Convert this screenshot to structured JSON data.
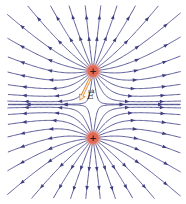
{
  "diagram": {
    "charges": [
      {
        "name": "upper-charge",
        "sign": "+",
        "x": 93,
        "y": 71,
        "r": 5.5
      },
      {
        "name": "lower-charge",
        "sign": "+",
        "x": 93,
        "y": 138,
        "r": 5.5
      }
    ],
    "field_vector": {
      "label": "E",
      "from": [
        90,
        79
      ],
      "to": [
        80,
        100
      ],
      "label_x": 87,
      "label_y": 92
    },
    "lines_per_charge": 24,
    "colors": {
      "field_line": "#4a4a8c",
      "arrow": "#3e3e80",
      "charge_fill": "#e06a55",
      "charge_glow": "#f3b3a5",
      "charge_sign": "#222222",
      "vector": "#e08a3a"
    }
  }
}
